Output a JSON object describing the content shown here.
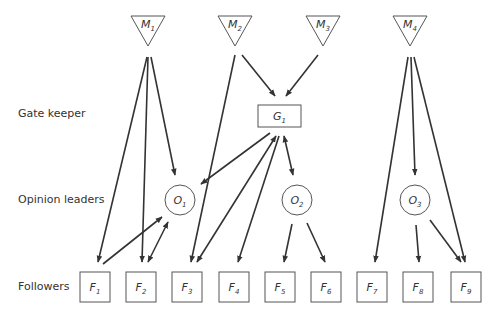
{
  "row_labels": {
    "gatekeeper": "Gate keeper",
    "opinion_leaders": "Opinion leaders",
    "followers": "Followers"
  },
  "colors": {
    "line": "#333333",
    "node_stroke": "#555555",
    "text": "#333333",
    "background": "#ffffff"
  },
  "media": [
    {
      "id": "M1",
      "letter": "M",
      "sub": "1",
      "cx": 148
    },
    {
      "id": "M2",
      "letter": "M",
      "sub": "2",
      "cx": 235
    },
    {
      "id": "M3",
      "letter": "M",
      "sub": "3",
      "cx": 323
    },
    {
      "id": "M4",
      "letter": "M",
      "sub": "4",
      "cx": 410
    }
  ],
  "gatekeepers": [
    {
      "id": "G1",
      "letter": "G",
      "sub": "1",
      "x": 258,
      "y": 105,
      "w": 43,
      "h": 22
    }
  ],
  "opinion_leaders": [
    {
      "id": "O1",
      "letter": "O",
      "sub": "1",
      "cx": 180,
      "cy": 200
    },
    {
      "id": "O2",
      "letter": "O",
      "sub": "2",
      "cx": 297,
      "cy": 200
    },
    {
      "id": "O3",
      "letter": "O",
      "sub": "3",
      "cx": 415,
      "cy": 200
    }
  ],
  "followers": [
    {
      "id": "F1",
      "letter": "F",
      "sub": "1",
      "x": 80
    },
    {
      "id": "F2",
      "letter": "F",
      "sub": "2",
      "x": 126
    },
    {
      "id": "F3",
      "letter": "F",
      "sub": "3",
      "x": 172
    },
    {
      "id": "F4",
      "letter": "F",
      "sub": "4",
      "x": 219
    },
    {
      "id": "F5",
      "letter": "F",
      "sub": "5",
      "x": 265
    },
    {
      "id": "F6",
      "letter": "F",
      "sub": "6",
      "x": 311
    },
    {
      "id": "F7",
      "letter": "F",
      "sub": "7",
      "x": 357
    },
    {
      "id": "F8",
      "letter": "F",
      "sub": "8",
      "x": 403
    },
    {
      "id": "F9",
      "letter": "F",
      "sub": "9",
      "x": 451
    }
  ],
  "edges": [
    {
      "from": "M1",
      "to": "F1",
      "x1": 147,
      "y1": 57,
      "x2": 98,
      "y2": 262,
      "heads": "end"
    },
    {
      "from": "M1",
      "to": "F2",
      "x1": 148,
      "y1": 57,
      "x2": 142,
      "y2": 262,
      "heads": "end"
    },
    {
      "from": "M1",
      "to": "O1",
      "x1": 151,
      "y1": 57,
      "x2": 175,
      "y2": 175,
      "heads": "end"
    },
    {
      "from": "M2",
      "to": "F3",
      "x1": 235,
      "y1": 55,
      "x2": 191,
      "y2": 262,
      "heads": "end"
    },
    {
      "from": "M2",
      "to": "G1",
      "x1": 242,
      "y1": 55,
      "x2": 275,
      "y2": 96,
      "heads": "end"
    },
    {
      "from": "M3",
      "to": "G1",
      "x1": 318,
      "y1": 55,
      "x2": 286,
      "y2": 96,
      "heads": "end"
    },
    {
      "from": "G1",
      "to": "O1",
      "x1": 270,
      "y1": 133,
      "x2": 201,
      "y2": 184,
      "heads": "end"
    },
    {
      "from": "G1",
      "to": "F3",
      "x1": 276,
      "y1": 136,
      "x2": 197,
      "y2": 262,
      "heads": "both"
    },
    {
      "from": "G1",
      "to": "F4",
      "x1": 279,
      "y1": 136,
      "x2": 238,
      "y2": 262,
      "heads": "end"
    },
    {
      "from": "G1",
      "to": "O2",
      "x1": 284,
      "y1": 136,
      "x2": 293,
      "y2": 175,
      "heads": "both"
    },
    {
      "from": "F1",
      "to": "O1",
      "x1": 103,
      "y1": 264,
      "x2": 162,
      "y2": 217,
      "heads": "end"
    },
    {
      "from": "F2",
      "to": "O1",
      "x1": 148,
      "y1": 262,
      "x2": 168,
      "y2": 222,
      "heads": "both"
    },
    {
      "from": "O2",
      "to": "F5",
      "x1": 292,
      "y1": 224,
      "x2": 284,
      "y2": 262,
      "heads": "end"
    },
    {
      "from": "O2",
      "to": "F6",
      "x1": 307,
      "y1": 223,
      "x2": 325,
      "y2": 262,
      "heads": "end"
    },
    {
      "from": "M4",
      "to": "F7",
      "x1": 408,
      "y1": 57,
      "x2": 375,
      "y2": 262,
      "heads": "end"
    },
    {
      "from": "M4",
      "to": "O3",
      "x1": 411,
      "y1": 57,
      "x2": 415,
      "y2": 175,
      "heads": "end"
    },
    {
      "from": "M4",
      "to": "F9",
      "x1": 414,
      "y1": 57,
      "x2": 465,
      "y2": 262,
      "heads": "end"
    },
    {
      "from": "O3",
      "to": "F8",
      "x1": 416,
      "y1": 225,
      "x2": 419,
      "y2": 262,
      "heads": "end"
    },
    {
      "from": "O3",
      "to": "F9",
      "x1": 430,
      "y1": 220,
      "x2": 461,
      "y2": 262,
      "heads": "end"
    }
  ]
}
